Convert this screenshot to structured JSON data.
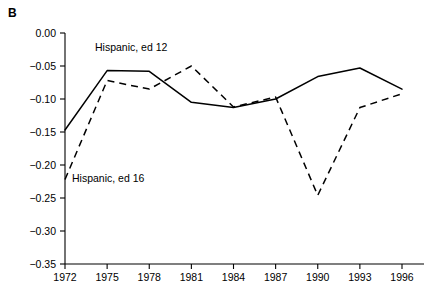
{
  "panel": {
    "letter": "B"
  },
  "chart_data": {
    "type": "line",
    "title": "",
    "subtitle": "",
    "xlabel": "",
    "ylabel": "",
    "x": [
      1972,
      1975,
      1978,
      1981,
      1984,
      1987,
      1990,
      1993,
      1996
    ],
    "xticklabels": [
      "1972",
      "1975",
      "1978",
      "1981",
      "1984",
      "1987",
      "1990",
      "1993",
      "1996"
    ],
    "xlim": [
      1972,
      1996
    ],
    "ylim": [
      -0.35,
      0.0
    ],
    "yticks": [
      0.0,
      -0.05,
      -0.1,
      -0.15,
      -0.2,
      -0.25,
      -0.3,
      -0.35
    ],
    "yticklabels": [
      "0.00",
      "-0.05",
      "-0.10",
      "-0.15",
      "-0.20",
      "-0.25",
      "-0.30",
      "-0.35"
    ],
    "grid": false,
    "legend_position": "inline-annotations",
    "series": [
      {
        "name": "Hispanic, ed 12",
        "style": "solid",
        "color": "#000000",
        "label_text": "Hispanic, ed 12",
        "values": [
          -0.147,
          -0.057,
          -0.058,
          -0.105,
          -0.113,
          -0.1,
          -0.066,
          -0.053,
          -0.085
        ]
      },
      {
        "name": "Hispanic, ed 16",
        "style": "dashed",
        "color": "#000000",
        "label_text": "Hispanic, ed 16",
        "values": [
          -0.222,
          -0.072,
          -0.085,
          -0.05,
          -0.112,
          -0.097,
          -0.246,
          -0.113,
          -0.092
        ]
      }
    ]
  }
}
